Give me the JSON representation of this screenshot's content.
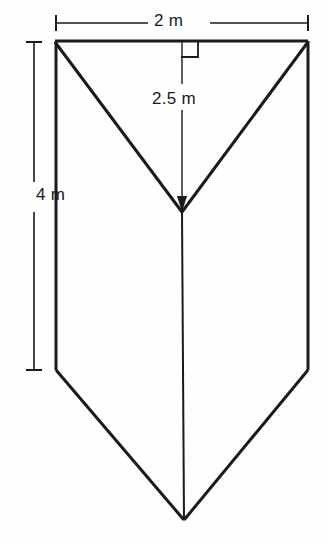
{
  "figure": {
    "background_color": "#fefefe",
    "line_color": "#1a1a1a",
    "label_color": "#1a1a1a",
    "width_px": 328,
    "height_px": 543
  },
  "labels": {
    "top_width": "2 m",
    "depth": "2.5 m",
    "side_height": "4 m",
    "cut_off_header": ""
  },
  "annotations": {
    "right_angle_marker": "right-angle",
    "right_angle_present": true
  },
  "geometry": {
    "top_left": [
      55,
      41
    ],
    "top_right": [
      308,
      41
    ],
    "front_apex": [
      182,
      212
    ],
    "left_bottom_bend": [
      56,
      370
    ],
    "right_bottom_bend": [
      308,
      370
    ],
    "back_apex": [
      184,
      520
    ],
    "dim_width_line_y": 23,
    "dim_width_x1": 56,
    "dim_width_x2": 308,
    "dim_height_line_x": 34,
    "dim_height_y1": 42,
    "dim_height_y2": 370,
    "dim_depth_line_x": 182,
    "dim_depth_y1": 41,
    "dim_depth_y2": 212
  },
  "measurements": {
    "top_width_value": 2,
    "depth_value": 2.5,
    "side_height_value": 4,
    "unit": "m"
  }
}
